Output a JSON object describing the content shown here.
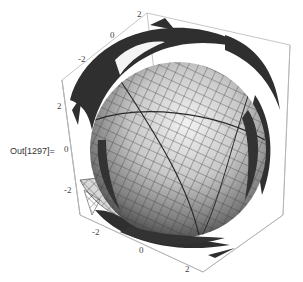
{
  "cell": {
    "out_label": "Out[1297]="
  },
  "graphics": {
    "type": "3d-plot",
    "description": "Shaded gridded sphere surrounded by spiky shell fragments inside a bounding box",
    "axes": {
      "top_ticks": [
        "-2",
        "0",
        "2"
      ],
      "left_ticks": [
        "2",
        "0",
        "-2"
      ],
      "bottom_ticks": [
        "-2",
        "0",
        "2"
      ]
    },
    "colors": {
      "box": "#b0b0b0",
      "sphere_light": "#e6e6e6",
      "sphere_dark": "#4a4a4a",
      "shell": "#2f2f2f",
      "mesh": "#3a3a3a"
    }
  }
}
